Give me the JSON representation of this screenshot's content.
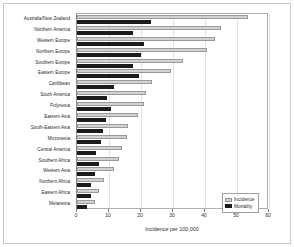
{
  "chart_data": {
    "type": "bar",
    "orientation": "horizontal",
    "title": "",
    "xlabel": "Incidence per 100,000",
    "ylabel": "",
    "xlim": [
      0,
      60
    ],
    "xticks": [
      0,
      10,
      20,
      30,
      40,
      50,
      60
    ],
    "grid": true,
    "legend_position": "bottom-right",
    "categories": [
      "Australia/New Zealand",
      "Northern America",
      "Western Europe",
      "Northern Europe",
      "Southern Europe",
      "Eastern Europe",
      "Caribbean",
      "South America",
      "Polynesia",
      "Eastern Asia",
      "South-Eastern Asia",
      "Micronesia",
      "Central America",
      "Southern Africa",
      "Western Asia",
      "Northern Africa",
      "Eastern Africa",
      "Melanesia"
    ],
    "series": [
      {
        "name": "Incidence",
        "color": "#d2d2d2",
        "values": [
          53.5,
          45.0,
          43.0,
          40.5,
          33.0,
          29.5,
          23.5,
          21.5,
          21.0,
          19.0,
          16.0,
          15.5,
          14.0,
          13.0,
          11.5,
          8.5,
          7.0,
          5.5
        ]
      },
      {
        "name": "Mortality",
        "color": "#1c1c1c",
        "values": [
          23.0,
          17.5,
          21.0,
          20.0,
          17.5,
          19.5,
          11.5,
          9.5,
          10.5,
          9.0,
          8.0,
          7.5,
          6.0,
          7.0,
          5.5,
          4.5,
          4.5,
          3.0
        ]
      }
    ]
  },
  "legend": {
    "items": [
      {
        "label": "Incidence"
      },
      {
        "label": "Mortality"
      }
    ]
  }
}
